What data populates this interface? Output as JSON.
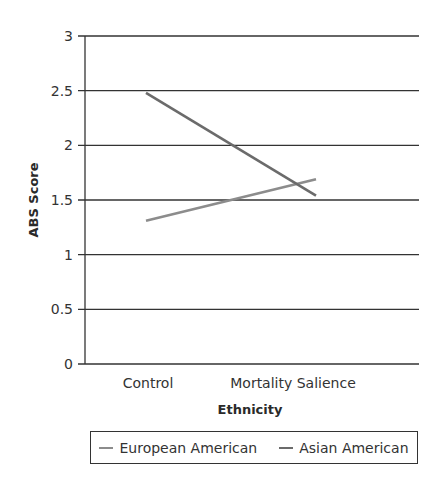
{
  "chart_data": {
    "type": "line",
    "title": "",
    "xlabel": "Ethnicity",
    "ylabel": "ABS Score",
    "categories": [
      "Control",
      "Mortality Salience"
    ],
    "series": [
      {
        "name": "European American",
        "values": [
          1.31,
          1.69
        ],
        "color": "#8c8c8c"
      },
      {
        "name": "Asian American",
        "values": [
          2.48,
          1.54
        ],
        "color": "#6b6b6b"
      }
    ],
    "ylim": [
      0,
      3
    ],
    "yticks": [
      "0",
      "0.5",
      "1",
      "1.5",
      "2",
      "2.5",
      "3"
    ],
    "ytick_values": [
      0,
      0.5,
      1,
      1.5,
      2,
      2.5,
      3
    ],
    "grid": true,
    "legend_position": "bottom"
  },
  "legend": {
    "items": [
      {
        "label": "European American",
        "color": "#8c8c8c"
      },
      {
        "label": "Asian American",
        "color": "#6b6b6b"
      }
    ]
  },
  "axes": {
    "x_title": "Ethnicity",
    "y_title": "ABS Score"
  }
}
